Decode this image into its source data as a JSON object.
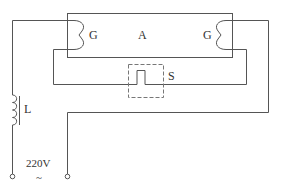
{
  "diagram": {
    "labels": {
      "tube": "A",
      "filament_left": "G",
      "filament_right": "G",
      "starter": "S",
      "ballast": "L",
      "voltage": "220V",
      "ac_symbol": "~"
    },
    "colors": {
      "line": "#555555",
      "dashed": "#777777",
      "text": "#333333"
    }
  }
}
